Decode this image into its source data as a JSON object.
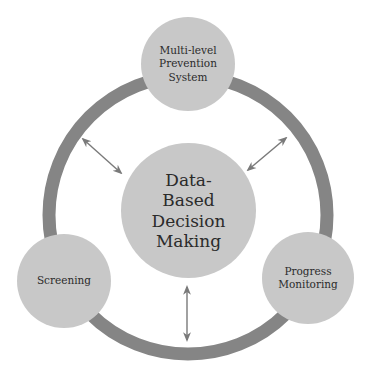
{
  "diagram": {
    "title": "",
    "colors": {
      "ring": "#858585",
      "node_fill": "#c8c8c8",
      "arrow": "#7a7a7a",
      "text": "#2b2b2b",
      "background": "#ffffff"
    },
    "center_node": {
      "label": "Data-\nBased\nDecision\nMaking"
    },
    "outer_nodes": [
      {
        "id": "prevention",
        "label": "Multi-level\nPrevention\nSystem",
        "position": "top"
      },
      {
        "id": "screening",
        "label": "Screening",
        "position": "bottom-left"
      },
      {
        "id": "progress",
        "label": "Progress\nMonitoring",
        "position": "bottom-right"
      }
    ],
    "connections": [
      {
        "from": "center",
        "to": "ring",
        "direction": "upper-left",
        "type": "bidirectional"
      },
      {
        "from": "center",
        "to": "ring",
        "direction": "upper-right",
        "type": "bidirectional"
      },
      {
        "from": "center",
        "to": "ring",
        "direction": "bottom",
        "type": "bidirectional"
      }
    ]
  }
}
